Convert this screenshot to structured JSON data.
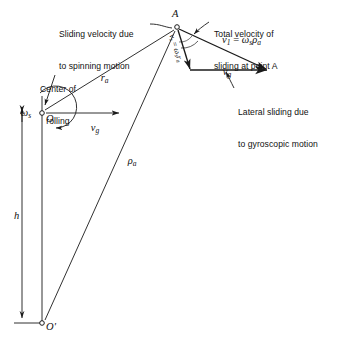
{
  "figure": {
    "background_color": "#ffffff",
    "line_color": "#1a1a1a",
    "text_color": "#111111",
    "width": 344,
    "height": 342
  },
  "callouts": {
    "sliding_spin": {
      "line1": "Sliding velocity due",
      "line2": "to spinning motion"
    },
    "total_velocity": {
      "line1": "Total velocity of",
      "line2": "sliding at point A"
    },
    "lateral_sliding": {
      "line1": "Lateral sliding due",
      "line2": "to gyroscopic motion"
    },
    "center_of_rolling": {
      "line1": "Center of",
      "line2": "rolling"
    }
  },
  "points": {
    "a": "A",
    "o": "O",
    "o_prime": "O'"
  },
  "labels": {
    "omega_s_left": "ωs",
    "omega_s_symbol": "ω",
    "omega_s_sub": "s",
    "v_g_lower": "vg",
    "v_g_upper": "vg",
    "v_g_symbol": "v",
    "v_g_sub": "g",
    "r_a": "ra",
    "r_a_symbol": "r",
    "r_a_sub": "a",
    "rho_a": "ρa",
    "rho_a_symbol": "ρ",
    "rho_a_sub": "a",
    "h": "h",
    "v_s_equation": "vs = ωs ra",
    "v1_equation": "v1 = ωs ρa"
  },
  "equations": {
    "total_velocity": {
      "lhs_symbol": "v",
      "lhs_sub": "1",
      "operator": "=",
      "rhs": "ωs ρa",
      "full": "v1 = ωsρa"
    },
    "spin_velocity": {
      "lhs_symbol": "v",
      "lhs_sub": "s",
      "operator": "=",
      "rhs": "ωs ra",
      "full": "vs = ωs ra"
    }
  },
  "geometry": {
    "point_a": {
      "x": 177,
      "y": 27
    },
    "point_o": {
      "x": 42,
      "y": 113
    },
    "point_o_prime": {
      "x": 42,
      "y": 323
    },
    "vg_lower_arrow_end": {
      "x": 118,
      "y": 113
    },
    "vg_upper_arrow_start": {
      "x": 190,
      "y": 70
    },
    "vg_upper_arrow_end": {
      "x": 266,
      "y": 70
    },
    "v1_arrow_end": {
      "x": 266,
      "y": 70
    },
    "vs_arrow_end": {
      "x": 190,
      "y": 70
    },
    "h_dimension_x": 22
  }
}
